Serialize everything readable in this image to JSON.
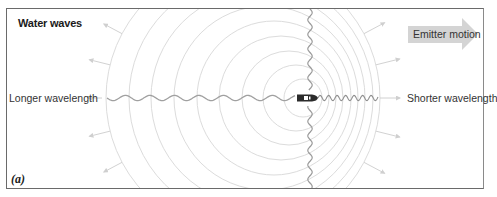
{
  "figure": {
    "title": "Water waves",
    "panel_label": "(a)",
    "left_label": "Longer wavelength",
    "right_label": "Shorter wavelength",
    "motion_label": "Emitter motion",
    "icons": {
      "emitter": "boat-icon",
      "motion": "arrow-right-icon"
    },
    "colors": {
      "wavefront": "#d9d9d9",
      "wave_line": "#9e9e9e",
      "arrow": "#d0d0d0",
      "motion_arrow": "#d3d3d3",
      "frame": "#6a6a6a",
      "boat": "#2b2b2b"
    },
    "wavefronts": [
      {
        "cx": 243,
        "r": 137
      },
      {
        "cx": 251,
        "r": 122
      },
      {
        "cx": 258,
        "r": 107
      },
      {
        "cx": 266,
        "r": 92
      },
      {
        "cx": 274,
        "r": 77
      },
      {
        "cx": 281,
        "r": 62
      },
      {
        "cx": 289,
        "r": 47
      },
      {
        "cx": 296,
        "r": 33
      },
      {
        "cx": 303,
        "r": 19
      }
    ],
    "center_y": 98
  }
}
